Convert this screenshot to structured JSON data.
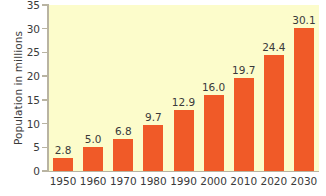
{
  "chart_data": {
    "type": "bar",
    "title": "",
    "xlabel": "",
    "ylabel": "Population in millions",
    "categories": [
      "1950",
      "1960",
      "1970",
      "1980",
      "1990",
      "2000",
      "2010",
      "2020",
      "2030"
    ],
    "values": [
      2.8,
      5.0,
      6.8,
      9.7,
      12.9,
      16.0,
      19.7,
      24.4,
      30.1
    ],
    "value_labels": [
      "2.8",
      "5.0",
      "6.8",
      "9.7",
      "12.9",
      "16.0",
      "19.7",
      "24.4",
      "30.1"
    ],
    "ylim": [
      0,
      35
    ],
    "yticks": [
      0,
      5,
      10,
      15,
      20,
      25,
      30,
      35
    ],
    "ytick_labels": [
      "0",
      "5",
      "10",
      "15",
      "20",
      "25",
      "30",
      "35"
    ],
    "grid": false,
    "legend": null,
    "colors": {
      "bar": "#f05a28",
      "plot_background": "#fcfccb",
      "axis": "#b9b4a2",
      "text": "#3a3a3a",
      "figure_background": "#ffffff"
    }
  }
}
